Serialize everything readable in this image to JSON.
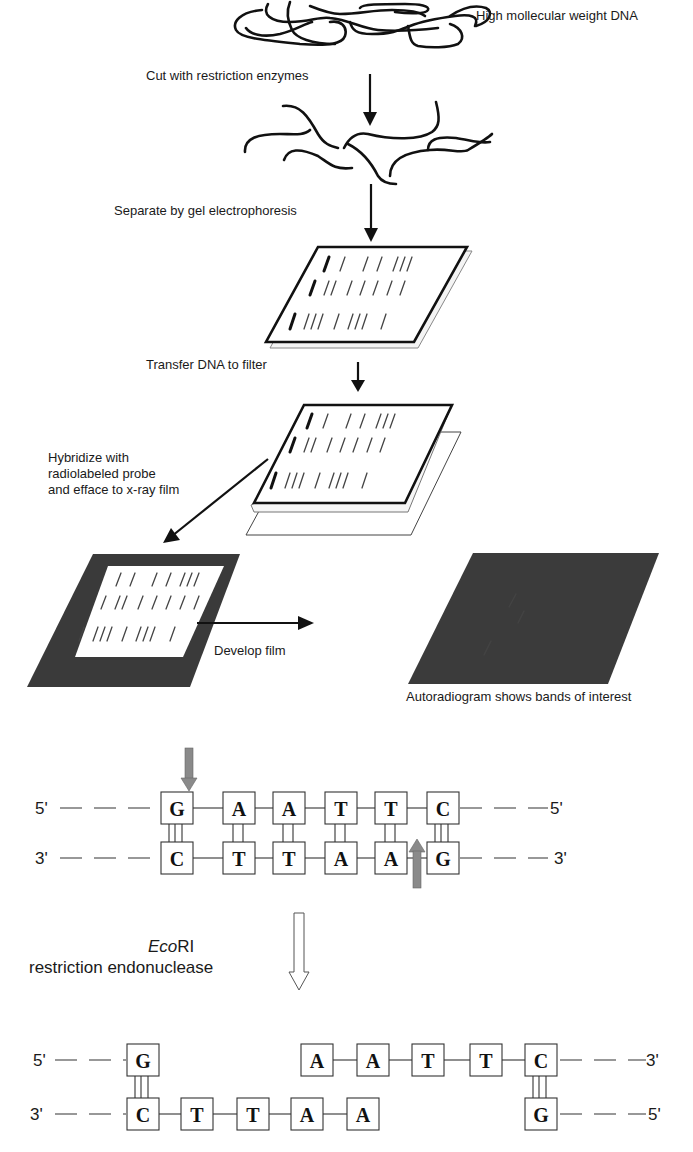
{
  "steps": {
    "dna_label": "High mollecular weight DNA",
    "cut_label": "Cut with restriction enzymes",
    "separate_label": "Separate by gel electrophoresis",
    "transfer_label": "Transfer DNA to filter",
    "hybridize_label_lines": [
      "Hybridize with",
      "radiolabeled probe",
      "and efface to x-ray film"
    ],
    "develop_label": "Develop film",
    "autoradiogram_label": "Autoradiogram shows bands of interest"
  },
  "colors": {
    "ink": "#111111",
    "film_dark": "#3a3a3a",
    "cut_arrow": "#8a8a8a",
    "band_white": "#f2f2f2"
  },
  "ecori": {
    "enzyme_name_italic": "Eco",
    "enzyme_name_suffix": "RI",
    "enzyme_desc": "restriction endonuclease",
    "intact": {
      "top_strand": {
        "left_end": "5'",
        "right_end": "5'",
        "bases": [
          "G",
          "A",
          "A",
          "T",
          "T",
          "C"
        ]
      },
      "bottom_strand": {
        "left_end": "3'",
        "right_end": "3'",
        "bases": [
          "C",
          "T",
          "T",
          "A",
          "A",
          "G"
        ]
      },
      "hydrogen_bonds": [
        3,
        2,
        2,
        2,
        2,
        3
      ],
      "cut_positions": {
        "top_after_index": 0,
        "bottom_after_index": 4
      }
    },
    "cut": {
      "left_fragment": {
        "top": {
          "end": "5'",
          "bases": [
            "G"
          ]
        },
        "bottom": {
          "end": "3'",
          "bases": [
            "C",
            "T",
            "T",
            "A",
            "A"
          ]
        }
      },
      "right_fragment": {
        "top": {
          "end": "3'",
          "bases": [
            "A",
            "A",
            "T",
            "T",
            "C"
          ]
        },
        "bottom": {
          "end": "5'",
          "bases": [
            "G"
          ]
        }
      }
    }
  }
}
